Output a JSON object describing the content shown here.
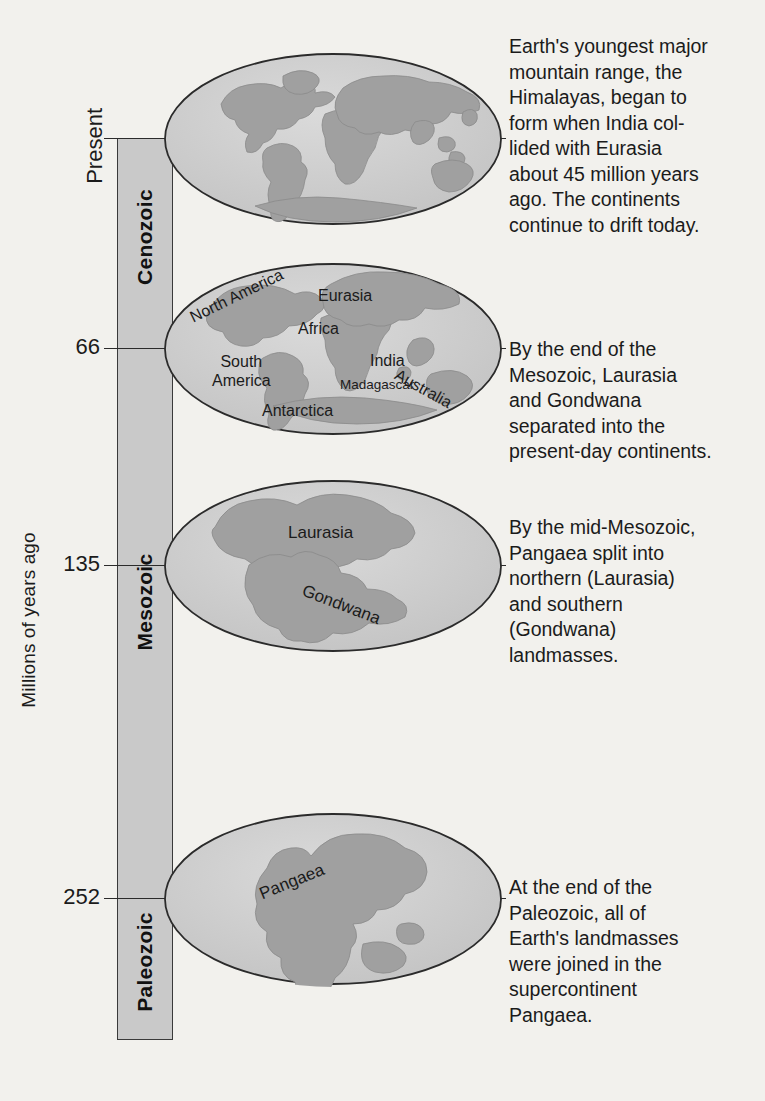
{
  "figure": {
    "type": "geologic-timescale-continental-drift",
    "axis": {
      "title": "Millions of years ago",
      "present_label": "Present",
      "ticks": [
        "Present",
        "66",
        "135",
        "252"
      ],
      "tick_values_ma": [
        0,
        66,
        135,
        252
      ]
    },
    "eras": [
      {
        "name": "Cenozoic",
        "start_ma": 66,
        "end_ma": 0
      },
      {
        "name": "Mesozoic",
        "start_ma": 252,
        "end_ma": 66
      },
      {
        "name": "Paleozoic",
        "start_ma": 252,
        "end_ma": 252
      }
    ],
    "panels": [
      {
        "tick": "Present",
        "globe_labels": [],
        "text": "Earth's youngest major\nmountain range, the\nHimalayas, began to\nform when India col-\nlided with Eurasia\nabout 45 million years\nago. The continents\ncontinue to drift today."
      },
      {
        "tick": "66",
        "globe_labels": [
          "North America",
          "Eurasia",
          "Africa",
          "South\nAmerica",
          "India",
          "Madagascar",
          "Australia",
          "Antarctica"
        ],
        "text": "By the end of the\nMesozoic, Laurasia\nand Gondwana\nseparated into the\npresent-day continents."
      },
      {
        "tick": "135",
        "globe_labels": [
          "Laurasia",
          "Gondwana"
        ],
        "text": "By the mid-Mesozoic,\nPangaea split into\nnorthern (Laurasia)\nand southern\n(Gondwana)\nlandmasses."
      },
      {
        "tick": "252",
        "globe_labels": [
          "Pangaea"
        ],
        "text": "At the end of the\nPaleozoic, all of\nEarth's landmasses\nwere joined in the\nsupercontinent\nPangaea."
      }
    ],
    "colors": {
      "background": "#f2f1ed",
      "band_fill": "#c9c9c9",
      "ocean_fill": "#cbcbcb",
      "land_fill": "#a3a3a3",
      "outline": "#2b2b2b",
      "text": "#1b1b1b"
    }
  }
}
